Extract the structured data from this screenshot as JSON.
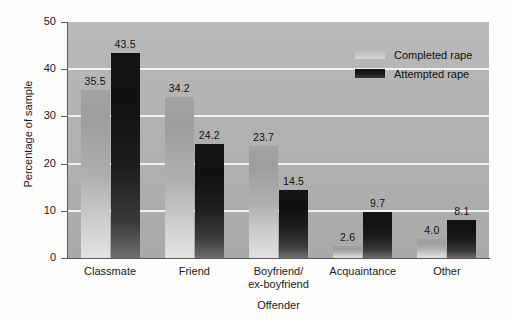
{
  "chart_data": {
    "type": "bar",
    "title": "",
    "xlabel": "Offender",
    "ylabel": "Percentage of sample",
    "categories": [
      "Classmate",
      "Friend",
      "Boyfriend/\nex-boyfriend",
      "Acquaintance",
      "Other"
    ],
    "category_lines": [
      [
        "Classmate"
      ],
      [
        "Friend"
      ],
      [
        "Boyfriend/",
        "ex-boyfriend"
      ],
      [
        "Acquaintance"
      ],
      [
        "Other"
      ]
    ],
    "series": [
      {
        "name": "Completed rape",
        "color": "#b0b0b0",
        "values": [
          35.5,
          34.2,
          23.7,
          2.6,
          4.0
        ],
        "labels": [
          "35.5",
          "34.2",
          "23.7",
          "2.6",
          "4.0"
        ]
      },
      {
        "name": "Attempted rape",
        "color": "#1a1a1a",
        "values": [
          43.5,
          24.2,
          14.5,
          9.7,
          8.1
        ],
        "labels": [
          "43.5",
          "24.2",
          "14.5",
          "9.7",
          "8.1"
        ]
      }
    ],
    "ylim": [
      0,
      50
    ],
    "yticks": [
      0,
      10,
      20,
      30,
      40,
      50
    ],
    "ytick_labels": [
      "0",
      "10",
      "20",
      "30",
      "40",
      "50"
    ],
    "grid": true,
    "gridlines_at": [
      10,
      20,
      30,
      40
    ],
    "legend_position": "top-right",
    "plot_background": "#b2b2b2",
    "gridline_color": "#f2f2f2",
    "figure_background": "#fdfdfc"
  },
  "legend": {
    "items": [
      {
        "label": "Completed rape"
      },
      {
        "label": "Attempted rape"
      }
    ]
  },
  "axes": {
    "y_title": "Percentage of sample",
    "x_title": "Offender"
  }
}
